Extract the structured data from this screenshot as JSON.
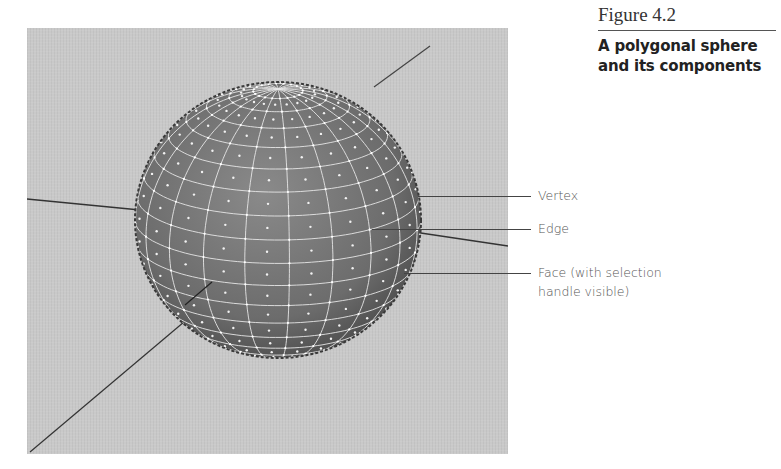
{
  "figure": {
    "number": "Figure 4.2",
    "title_line1": "A polygonal sphere",
    "title_line2": "and its components"
  },
  "callouts": [
    {
      "label": "Vertex",
      "y": 196
    },
    {
      "label": "Edge",
      "y": 229
    },
    {
      "label": "Face (with selection",
      "label2": "handle visible)",
      "y": 273
    }
  ],
  "viewport": {
    "background": "#c9c9c9",
    "sphere_color": "#6f6f6f",
    "wire_color": "#e8e8e8",
    "axis_color": "#333333"
  }
}
